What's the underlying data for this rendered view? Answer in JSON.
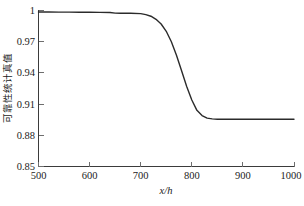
{
  "chart_data": {
    "type": "line",
    "title": "",
    "subtitle": "",
    "xlabel": "x/h",
    "ylabel": "可靠性统计真值",
    "xlim": [
      500,
      1000
    ],
    "ylim": [
      0.85,
      1.0
    ],
    "xticks": [
      500,
      600,
      700,
      800,
      900,
      1000
    ],
    "yticks": [
      0.85,
      0.88,
      0.91,
      0.94,
      0.97,
      1
    ],
    "xtick_labels": [
      "500",
      "600",
      "700",
      "800",
      "900",
      "1000"
    ],
    "ytick_labels": [
      "0.85",
      "0.88",
      "0.91",
      "0.94",
      "0.97",
      "1"
    ],
    "grid": false,
    "legend": null,
    "legend_position": "none",
    "series": [
      {
        "name": "可靠性统计真值",
        "color": "#2b2b2b",
        "x": [
          500,
          520,
          540,
          560,
          580,
          600,
          620,
          640,
          650,
          660,
          680,
          700,
          710,
          720,
          730,
          740,
          750,
          760,
          770,
          780,
          790,
          800,
          810,
          820,
          830,
          840,
          850,
          860,
          880,
          900,
          920,
          940,
          960,
          980,
          1000
        ],
        "y": [
          0.9985,
          0.9985,
          0.9984,
          0.9984,
          0.9983,
          0.9983,
          0.9982,
          0.9981,
          0.9975,
          0.9974,
          0.9973,
          0.997,
          0.996,
          0.9945,
          0.9915,
          0.987,
          0.98,
          0.97,
          0.957,
          0.942,
          0.927,
          0.914,
          0.904,
          0.899,
          0.8965,
          0.8958,
          0.8955,
          0.8955,
          0.8955,
          0.8955,
          0.8955,
          0.8955,
          0.8955,
          0.8955,
          0.8955
        ]
      }
    ],
    "annotations": []
  },
  "axes": {
    "x_label": "x/h",
    "y_label": "可靠性统计真值"
  },
  "caption": {
    "text": ""
  }
}
